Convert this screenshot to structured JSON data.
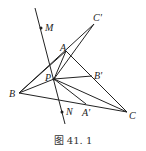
{
  "figure": {
    "caption": "图 41. 1",
    "points": {
      "M": {
        "label": "M",
        "x": 41,
        "y": 28
      },
      "N": {
        "label": "N",
        "x": 62,
        "y": 112
      },
      "A": {
        "label": "A",
        "x": 66,
        "y": 51
      },
      "B": {
        "label": "B",
        "x": 19,
        "y": 93
      },
      "C": {
        "label": "C",
        "x": 127,
        "y": 112
      },
      "P": {
        "label": "P",
        "x": 54,
        "y": 79
      },
      "A_prime": {
        "label": "A'",
        "x": 86,
        "y": 104
      },
      "B_prime": {
        "label": "B'",
        "x": 92,
        "y": 76
      },
      "C_prime": {
        "label": "C'",
        "x": 94,
        "y": 24
      }
    },
    "line_MN": {
      "x1": 35,
      "y1": 8,
      "x2": 65,
      "y2": 124
    }
  }
}
